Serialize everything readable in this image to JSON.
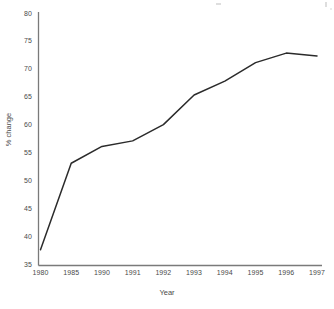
{
  "chart_data": {
    "type": "line",
    "title": "",
    "subtitle": "",
    "xlabel": "Year",
    "ylabel": "% change",
    "categories": [
      "1980",
      "1985",
      "1990",
      "1991",
      "1992",
      "1993",
      "1994",
      "1995",
      "1996",
      "1997"
    ],
    "values": [
      37.8,
      53.3,
      56.3,
      57.3,
      60.2,
      65.5,
      68.0,
      71.3,
      73.0,
      72.5
    ],
    "series": [
      {
        "name": "% change",
        "values": [
          37.8,
          53.3,
          56.3,
          57.3,
          60.2,
          65.5,
          68.0,
          71.3,
          73.0,
          72.5
        ]
      }
    ],
    "ylim": [
      35,
      80
    ],
    "yticks": [
      35,
      40,
      45,
      50,
      55,
      60,
      65,
      70,
      75,
      80
    ],
    "ytick_labels": [
      "35",
      "40",
      "45",
      "50",
      "55",
      "60",
      "65",
      "70",
      "75",
      "80"
    ],
    "xtick_labels": [
      "1980",
      "1985",
      "1990",
      "1991",
      "1992",
      "1993",
      "1994",
      "1995",
      "1996",
      "1997"
    ],
    "grid": false,
    "legend": false,
    "legend_position": "none",
    "line_color": "#2b2b2b",
    "axis_color": "#7a7a7a",
    "background_color": "#ffffff",
    "annotations": []
  },
  "axes": {
    "x_axis_label": "Year",
    "y_axis_label": "% change"
  }
}
